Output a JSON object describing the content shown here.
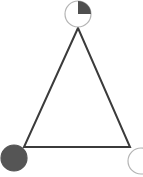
{
  "figure": {
    "name": "triangle-node-diagram",
    "width": 143,
    "height": 177,
    "background_color": "#ffffff"
  },
  "colors": {
    "edge_stroke": "#3b3b3b",
    "node_outline": "#b4b4b4",
    "node_fill_dark": "#555555",
    "node_fill_empty": "#ffffff",
    "quadrant_fill": "#4f4f4f"
  },
  "triangle": {
    "name": "triangle-outline",
    "stroke_width": 2,
    "fill": "none",
    "vertices": [
      {
        "id": "apex",
        "label": "top",
        "x": 78,
        "y": 28
      },
      {
        "id": "bottom-left",
        "label": "bottom left",
        "x": 24,
        "y": 147
      },
      {
        "id": "bottom-right",
        "label": "bottom right",
        "x": 130,
        "y": 147
      }
    ]
  },
  "nodes": [
    {
      "id": "node-top",
      "label": "top",
      "state": "quarter-filled",
      "fill_fraction": 0.25,
      "filled_quadrant": "upper-right",
      "cx": 78,
      "cy": 14,
      "r": 13,
      "outline_width": 1.2
    },
    {
      "id": "node-bottom-left",
      "label": "bottom left",
      "state": "filled",
      "fill_fraction": 1,
      "filled_quadrant": "all",
      "cx": 14,
      "cy": 158,
      "r": 13,
      "outline_width": 1.2
    },
    {
      "id": "node-bottom-right",
      "label": "bottom right",
      "state": "empty",
      "fill_fraction": 0,
      "filled_quadrant": "none",
      "cx": 141,
      "cy": 161,
      "r": 13,
      "outline_width": 1.2
    }
  ],
  "chart_data": {
    "type": "diagram",
    "nodes": [
      {
        "name": "top",
        "x": 78,
        "y": 14,
        "fill_fraction": 0.25
      },
      {
        "name": "bottom left",
        "x": 14,
        "y": 158,
        "fill_fraction": 1
      },
      {
        "name": "bottom right",
        "x": 141,
        "y": 161,
        "fill_fraction": 0
      }
    ],
    "edges": [
      {
        "from": "top",
        "to": "bottom left"
      },
      {
        "from": "bottom left",
        "to": "bottom right"
      },
      {
        "from": "bottom right",
        "to": "top"
      }
    ],
    "grid": false,
    "legend": "none"
  }
}
